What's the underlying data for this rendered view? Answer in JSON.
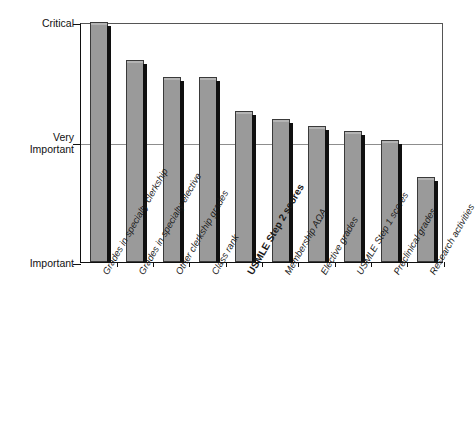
{
  "chart_data": {
    "type": "bar",
    "title": "",
    "xlabel": "",
    "ylabel": "",
    "grid": true,
    "legend": false,
    "orientation": "vertical",
    "y_axis": {
      "type": "ordinal-scale",
      "tick_labels": [
        "Critical",
        "Very\nImportant",
        "Important"
      ],
      "tick_values": [
        2,
        1,
        0
      ],
      "ylim": [
        0,
        2
      ]
    },
    "categories": [
      "Grades in specialty clerkship",
      "Grades in specialty elective",
      "Other clerkship grades",
      "Class rank",
      "USMLE Step 2 scores",
      "Membership AΩA",
      "Elective grades",
      "USMLE Step 1 scores",
      "Preclinical grades",
      "Research activities"
    ],
    "values": [
      2.0,
      1.68,
      1.54,
      1.54,
      1.26,
      1.19,
      1.13,
      1.09,
      1.02,
      0.71
    ],
    "highlighted_category": "USMLE Step 2 scores",
    "bar_fill_color": "#9a9a9a",
    "bar_edge_color": "#3a3a3a",
    "bar_shadow_color": "#101010",
    "axis_color": "#111111",
    "gridline_color": "#8d8d8d",
    "background_color": "#ffffff"
  },
  "yaxis": {
    "ticks": [
      {
        "label": "Critical",
        "value": 2
      },
      {
        "label": "Very\nImportant",
        "value": 1
      },
      {
        "label": "Important",
        "value": 0
      }
    ]
  },
  "bars": [
    {
      "label": "Grades in specialty clerkship",
      "value": 2.0,
      "bold": false
    },
    {
      "label": "Grades in specialty elective",
      "value": 1.68,
      "bold": false
    },
    {
      "label": "Other clerkship grades",
      "value": 1.54,
      "bold": false
    },
    {
      "label": "Class rank",
      "value": 1.54,
      "bold": false
    },
    {
      "label": "USMLE Step 2 scores",
      "value": 1.26,
      "bold": true
    },
    {
      "label": "Membership AΩA",
      "value": 1.19,
      "bold": false
    },
    {
      "label": "Elective grades",
      "value": 1.13,
      "bold": false
    },
    {
      "label": "USMLE Step 1 scores",
      "value": 1.09,
      "bold": false
    },
    {
      "label": "Preclinical grades",
      "value": 1.02,
      "bold": false
    },
    {
      "label": "Research activities",
      "value": 0.71,
      "bold": false
    }
  ]
}
